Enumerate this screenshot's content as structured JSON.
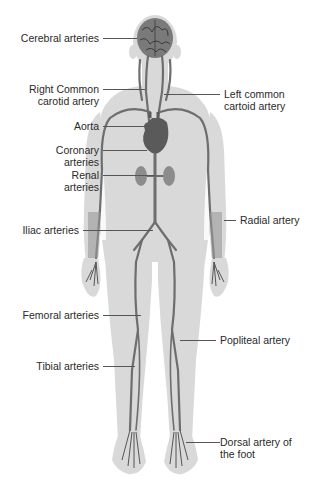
{
  "diagram": {
    "colors": {
      "background": "#ffffff",
      "body_silhouette": "#d9d9d9",
      "artery": "#6e6e6e",
      "organ": "#8c8c8c",
      "leader_line": "#555555",
      "text": "#2a2a2a"
    },
    "labels_left": [
      {
        "id": "cerebral",
        "lines": [
          "Cerebral arteries"
        ]
      },
      {
        "id": "right-common-carotid",
        "lines": [
          "Right Common",
          "carotid artery"
        ]
      },
      {
        "id": "aorta",
        "lines": [
          "Aorta"
        ]
      },
      {
        "id": "coronary",
        "lines": [
          "Coronary",
          "arteries"
        ]
      },
      {
        "id": "renal",
        "lines": [
          "Renal",
          "arteries"
        ]
      },
      {
        "id": "iliac",
        "lines": [
          "Iliac arteries"
        ]
      },
      {
        "id": "femoral",
        "lines": [
          "Femoral arteries"
        ]
      },
      {
        "id": "tibial",
        "lines": [
          "Tibial arteries"
        ]
      }
    ],
    "labels_right": [
      {
        "id": "left-common-carotid",
        "lines": [
          "Left common",
          "cartoid artery"
        ]
      },
      {
        "id": "radial",
        "lines": [
          "Radial artery"
        ]
      },
      {
        "id": "popliteal",
        "lines": [
          "Popliteal artery"
        ]
      },
      {
        "id": "dorsal-foot",
        "lines": [
          "Dorsal artery of",
          "the foot"
        ]
      }
    ]
  }
}
